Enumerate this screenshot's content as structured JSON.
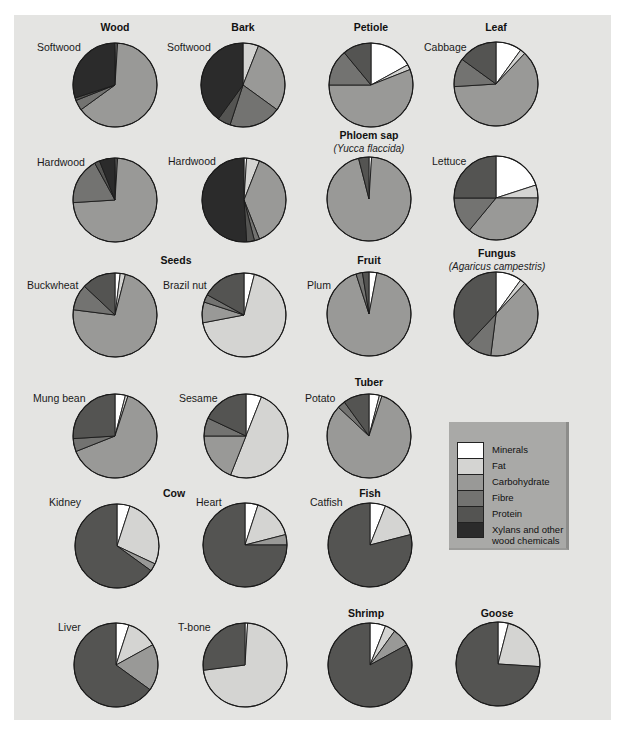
{
  "legend": {
    "items": [
      {
        "label": "Minerals",
        "color": "#ffffff"
      },
      {
        "label": "Fat",
        "color": "#d4d4d2"
      },
      {
        "label": "Carbohydrate",
        "color": "#999997"
      },
      {
        "label": "Fibre",
        "color": "#737371"
      },
      {
        "label": "Protein",
        "color": "#545452"
      },
      {
        "label": "Xylans and other",
        "label2": "wood chemicals",
        "color": "#2b2b2b"
      }
    ]
  },
  "groups": {
    "wood": "Wood",
    "bark": "Bark",
    "petiole": "Petiole",
    "leaf": "Leaf",
    "phloem": "Phloem sap",
    "phloem_sub": "(Yucca flaccida)",
    "seeds": "Seeds",
    "fruit": "Fruit",
    "fungus": "Fungus",
    "fungus_sub": "(Agaricus campestris)",
    "tuber": "Tuber",
    "cow": "Cow",
    "fish": "Fish",
    "shrimp": "Shrimp",
    "goose": "Goose"
  },
  "labels": {
    "wood_softwood": "Softwood",
    "bark_softwood": "Softwood",
    "cabbage": "Cabbage",
    "wood_hardwood": "Hardwood",
    "bark_hardwood": "Hardwood",
    "lettuce": "Lettuce",
    "buckwheat": "Buckwheat",
    "brazil": "Brazil nut",
    "plum": "Plum",
    "mung": "Mung bean",
    "sesame": "Sesame",
    "potato": "Potato",
    "kidney": "Kidney",
    "heart": "Heart",
    "catfish": "Catfish",
    "liver": "Liver",
    "tbone": "T-bone"
  },
  "chart_data": {
    "type": "pie",
    "title": "",
    "categories": [
      "Minerals",
      "Fat",
      "Carbohydrate",
      "Fibre",
      "Protein",
      "Xylans and other wood chemicals"
    ],
    "legend_position": "right-middle",
    "pies": [
      {
        "name": "Wood - Softwood",
        "cx": 115,
        "cy": 85,
        "values": [
          0.5,
          0.5,
          64,
          4,
          1,
          30
        ]
      },
      {
        "name": "Bark - Softwood",
        "cx": 243,
        "cy": 85,
        "values": [
          0,
          6,
          29,
          20,
          5,
          40
        ]
      },
      {
        "name": "Petiole",
        "cx": 371,
        "cy": 85,
        "values": [
          17,
          2,
          56,
          14,
          11,
          0
        ]
      },
      {
        "name": "Leaf - Cabbage",
        "cx": 496,
        "cy": 84,
        "values": [
          10,
          2,
          62,
          11,
          15,
          0
        ]
      },
      {
        "name": "Wood - Hardwood",
        "cx": 115,
        "cy": 200,
        "values": [
          0.5,
          0.5,
          73,
          18,
          2,
          6
        ]
      },
      {
        "name": "Bark - Hardwood",
        "cx": 244,
        "cy": 200,
        "values": [
          1,
          5,
          38,
          2,
          3,
          51
        ]
      },
      {
        "name": "Phloem sap (Yucca flaccida)",
        "cx": 369,
        "cy": 199,
        "values": [
          1,
          0,
          95,
          0,
          4,
          0
        ]
      },
      {
        "name": "Leaf - Lettuce",
        "cx": 496,
        "cy": 198,
        "values": [
          20,
          5,
          36,
          14,
          25,
          0
        ]
      },
      {
        "name": "Seeds - Buckwheat",
        "cx": 115,
        "cy": 315,
        "values": [
          2,
          2,
          73,
          10,
          13,
          0
        ]
      },
      {
        "name": "Seeds - Brazil nut",
        "cx": 244,
        "cy": 315,
        "values": [
          4,
          68,
          8,
          3,
          17,
          0
        ]
      },
      {
        "name": "Fruit - Plum",
        "cx": 369,
        "cy": 314,
        "values": [
          3,
          0,
          92,
          2.5,
          2.5,
          0
        ]
      },
      {
        "name": "Fungus (Agaricus campestris)",
        "cx": 496,
        "cy": 314,
        "values": [
          10,
          2,
          40,
          10,
          38,
          0
        ]
      },
      {
        "name": "Seeds - Mung bean",
        "cx": 115,
        "cy": 436,
        "values": [
          4,
          1,
          64,
          5,
          26,
          0
        ]
      },
      {
        "name": "Seeds - Sesame",
        "cx": 246,
        "cy": 436,
        "values": [
          6,
          50,
          19,
          7,
          18,
          0
        ]
      },
      {
        "name": "Tuber - Potato",
        "cx": 369,
        "cy": 436,
        "values": [
          4,
          1,
          82,
          3,
          10,
          0
        ]
      },
      {
        "name": "Cow - Kidney",
        "cx": 117,
        "cy": 546,
        "values": [
          5,
          27,
          3,
          0,
          65,
          0
        ]
      },
      {
        "name": "Cow - Heart",
        "cx": 245,
        "cy": 545,
        "values": [
          5,
          16,
          4,
          0,
          75,
          0
        ]
      },
      {
        "name": "Fish - Catfish",
        "cx": 370,
        "cy": 545,
        "values": [
          6,
          15,
          0,
          0,
          79,
          0
        ]
      },
      {
        "name": "Cow - Liver",
        "cx": 116,
        "cy": 665,
        "values": [
          5,
          12,
          18,
          0,
          65,
          0
        ]
      },
      {
        "name": "Cow - T-bone",
        "cx": 245,
        "cy": 665,
        "values": [
          1,
          72,
          0,
          0,
          27,
          0
        ]
      },
      {
        "name": "Shrimp",
        "cx": 370,
        "cy": 665,
        "values": [
          6,
          4,
          7,
          0,
          83,
          0
        ]
      },
      {
        "name": "Goose",
        "cx": 498,
        "cy": 664,
        "values": [
          4,
          22,
          0,
          0,
          74,
          0
        ]
      }
    ],
    "radius": 42
  }
}
